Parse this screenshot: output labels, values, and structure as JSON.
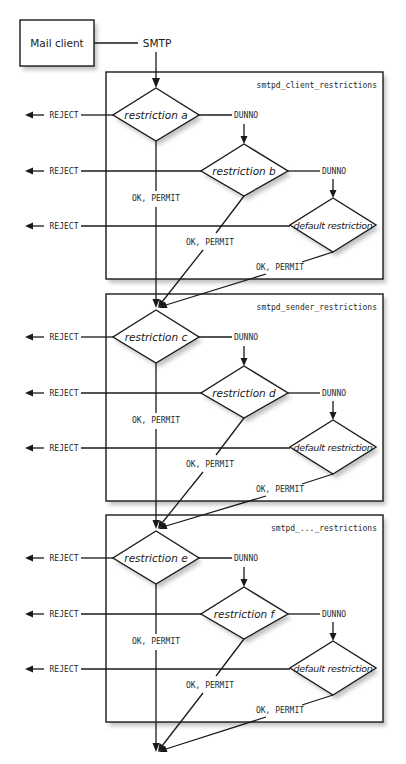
{
  "source": {
    "label": "Mail client"
  },
  "protocol": {
    "label": "SMTP"
  },
  "panels": [
    {
      "title": "smtpd_client_restrictions",
      "restrictions": [
        "restriction a",
        "restriction b",
        "default restriction"
      ]
    },
    {
      "title": "smtpd_sender_restrictions",
      "restrictions": [
        "restriction c",
        "restriction d",
        "default restriction"
      ]
    },
    {
      "title": "smtpd_..._restrictions",
      "restrictions": [
        "restriction e",
        "restriction f",
        "default restriction"
      ]
    }
  ],
  "outcomes": {
    "reject": "REJECT",
    "dunno": "DUNNO",
    "permit": "OK, PERMIT"
  },
  "colors": {
    "line": "#1a1a1a",
    "background": "#ffffff",
    "shadow": "#8c8c8c"
  }
}
